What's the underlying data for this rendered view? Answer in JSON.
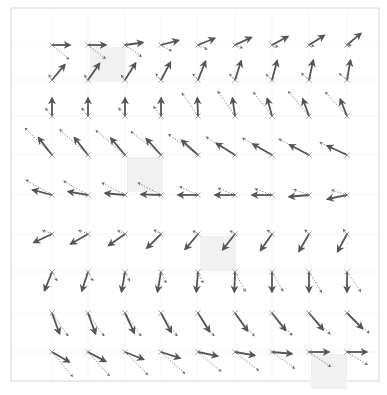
{
  "chart_data": {
    "type": "quiver",
    "title": "",
    "caption": "",
    "frame": {
      "x0": 11,
      "y0": 8,
      "x1": 379,
      "y1": 381,
      "border_color": "#d4d4d4"
    },
    "grid": {
      "on": true,
      "color": "#f0f0f0"
    },
    "x_centers": [
      52,
      88,
      125,
      161,
      198,
      235,
      272,
      309,
      347
    ],
    "y_centers": [
      45,
      80,
      116,
      155,
      195,
      234,
      272,
      313,
      352
    ],
    "highlight_cells": [
      {
        "col": 1,
        "row": 0
      },
      {
        "col": 2,
        "row": 3
      },
      {
        "col": 4,
        "row": 5
      },
      {
        "col": 7,
        "row": 8
      }
    ],
    "highlight_color": "#f1f1f1",
    "arrow_color": "#555555",
    "dashed_color": "#888888",
    "series": [
      {
        "name": "solid",
        "style": "solid",
        "rows": [
          [
            [
              0,
              18
            ],
            [
              0,
              18
            ],
            [
              -8,
              18
            ],
            [
              -15,
              18
            ],
            [
              -22,
              18
            ],
            [
              -25,
              18
            ],
            [
              -28,
              18
            ],
            [
              -32,
              18
            ],
            [
              -40,
              18
            ]
          ],
          [
            [
              -50,
              20
            ],
            [
              -55,
              20
            ],
            [
              -58,
              20
            ],
            [
              -62,
              20
            ],
            [
              -68,
              20
            ],
            [
              -72,
              20
            ],
            [
              -75,
              20
            ],
            [
              -78,
              20
            ],
            [
              -80,
              20
            ]
          ],
          [
            [
              -90,
              18
            ],
            [
              -90,
              18
            ],
            [
              -90,
              18
            ],
            [
              -90,
              18
            ],
            [
              -92,
              18
            ],
            [
              -98,
              18
            ],
            [
              -105,
              18
            ],
            [
              -110,
              18
            ],
            [
              -112,
              18
            ]
          ],
          [
            [
              -128,
              22
            ],
            [
              -128,
              22
            ],
            [
              -130,
              22
            ],
            [
              -132,
              22
            ],
            [
              -138,
              22
            ],
            [
              -148,
              22
            ],
            [
              -150,
              22
            ],
            [
              -152,
              22
            ],
            [
              -155,
              22
            ]
          ],
          [
            [
              -165,
              20
            ],
            [
              -170,
              20
            ],
            [
              -175,
              20
            ],
            [
              -178,
              20
            ],
            [
              -180,
              20
            ],
            [
              -180,
              20
            ],
            [
              180,
              20
            ],
            [
              175,
              20
            ],
            [
              168,
              20
            ]
          ],
          [
            [
              155,
              20
            ],
            [
              150,
              20
            ],
            [
              145,
              20
            ],
            [
              135,
              20
            ],
            [
              130,
              20
            ],
            [
              128,
              20
            ],
            [
              125,
              20
            ],
            [
              120,
              20
            ],
            [
              118,
              20
            ]
          ],
          [
            [
              112,
              20
            ],
            [
              108,
              20
            ],
            [
              100,
              20
            ],
            [
              100,
              20
            ],
            [
              95,
              20
            ],
            [
              92,
              20
            ],
            [
              90,
              20
            ],
            [
              90,
              20
            ],
            [
              90,
              20
            ]
          ],
          [
            [
              70,
              22
            ],
            [
              70,
              22
            ],
            [
              65,
              22
            ],
            [
              62,
              22
            ],
            [
              58,
              22
            ],
            [
              55,
              22
            ],
            [
              52,
              22
            ],
            [
              50,
              22
            ],
            [
              45,
              22
            ]
          ],
          [
            [
              30,
              20
            ],
            [
              28,
              20
            ],
            [
              22,
              20
            ],
            [
              18,
              20
            ],
            [
              12,
              20
            ],
            [
              10,
              20
            ],
            [
              5,
              20
            ],
            [
              0,
              20
            ],
            [
              0,
              20
            ]
          ]
        ]
      },
      {
        "name": "dashed",
        "style": "dashed",
        "rows": [
          [
            [
              40,
              22
            ],
            [
              38,
              22
            ],
            [
              35,
              20
            ],
            [
              30,
              12
            ],
            [
              25,
              10
            ],
            [
              22,
              8
            ],
            [
              18,
              6
            ],
            [
              12,
              5
            ],
            [
              8,
              4
            ]
          ],
          [
            [
              -120,
              6
            ],
            [
              -125,
              6
            ],
            [
              -128,
              6
            ],
            [
              -130,
              8
            ],
            [
              -130,
              8
            ],
            [
              -132,
              8
            ],
            [
              -135,
              8
            ],
            [
              -138,
              10
            ],
            [
              -140,
              10
            ]
          ],
          [
            [
              -130,
              10
            ],
            [
              -128,
              10
            ],
            [
              -128,
              10
            ],
            [
              -128,
              12
            ],
            [
              -125,
              28
            ],
            [
              -125,
              30
            ],
            [
              -128,
              30
            ],
            [
              -130,
              32
            ],
            [
              -132,
              32
            ]
          ],
          [
            [
              -135,
              38
            ],
            [
              -138,
              38
            ],
            [
              -140,
              38
            ],
            [
              -142,
              38
            ],
            [
              -145,
              36
            ],
            [
              -148,
              34
            ],
            [
              -150,
              34
            ],
            [
              -152,
              34
            ],
            [
              -155,
              30
            ]
          ],
          [
            [
              -150,
              30
            ],
            [
              -150,
              28
            ],
            [
              -152,
              26
            ],
            [
              -152,
              26
            ],
            [
              -155,
              20
            ],
            [
              -158,
              18
            ],
            [
              -160,
              18
            ],
            [
              -160,
              16
            ],
            [
              -162,
              16
            ]
          ],
          [
            [
              -160,
              10
            ],
            [
              -158,
              10
            ],
            [
              -155,
              8
            ],
            [
              -150,
              8
            ],
            [
              -148,
              6
            ],
            [
              -145,
              6
            ],
            [
              -140,
              6
            ],
            [
              -135,
              6
            ],
            [
              -130,
              6
            ]
          ],
          [
            [
              60,
              10
            ],
            [
              60,
              10
            ],
            [
              62,
              10
            ],
            [
              65,
              12
            ],
            [
              65,
              12
            ],
            [
              62,
              22
            ],
            [
              60,
              22
            ],
            [
              58,
              24
            ],
            [
              55,
              24
            ]
          ],
          [
            [
              55,
              28
            ],
            [
              55,
              28
            ],
            [
              55,
              28
            ],
            [
              55,
              28
            ],
            [
              55,
              28
            ],
            [
              50,
              30
            ],
            [
              48,
              30
            ],
            [
              45,
              30
            ],
            [
              42,
              30
            ]
          ],
          [
            [
              50,
              32
            ],
            [
              48,
              32
            ],
            [
              45,
              32
            ],
            [
              42,
              32
            ],
            [
              40,
              30
            ],
            [
              38,
              30
            ],
            [
              36,
              28
            ],
            [
              34,
              26
            ],
            [
              32,
              24
            ]
          ]
        ]
      }
    ]
  }
}
